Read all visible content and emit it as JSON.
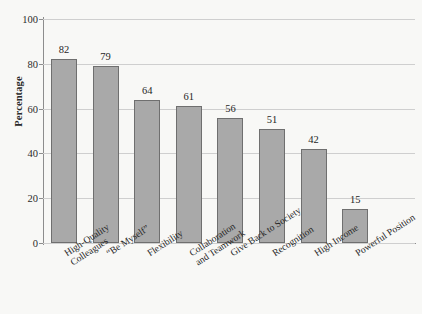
{
  "chart_data": {
    "type": "bar",
    "title": "",
    "subtitle": "",
    "xlabel": "",
    "ylabel": "Percentage",
    "ylim": [
      0,
      100
    ],
    "yticks": [
      0,
      20,
      40,
      60,
      80,
      100
    ],
    "grid": true,
    "legend": false,
    "bar_color": "#a9a9a9",
    "bar_edge_color": "#6f6f6f",
    "categories": [
      "High-Quality\nColleagues",
      "“Be Myself”",
      "Flexibility",
      "Collaboration\nand Teamwork",
      "Give Back to Society",
      "Recognition",
      "High Income",
      "Powerful Position"
    ],
    "category_lines": [
      [
        "High-Quality",
        "Colleagues"
      ],
      [
        "“Be Myself”"
      ],
      [
        "Flexibility"
      ],
      [
        "Collaboration",
        "and Teamwork"
      ],
      [
        "Give Back to Society"
      ],
      [
        "Recognition"
      ],
      [
        "High Income"
      ],
      [
        "Powerful Position"
      ]
    ],
    "values": [
      82,
      79,
      64,
      61,
      56,
      51,
      42,
      15
    ],
    "value_labels": [
      "82",
      "79",
      "64",
      "61",
      "56",
      "51",
      "42",
      "15"
    ]
  },
  "axis": {
    "y_title": "Percentage",
    "y_tick_labels": [
      "100",
      "80",
      "60",
      "40",
      "20",
      "0"
    ]
  }
}
